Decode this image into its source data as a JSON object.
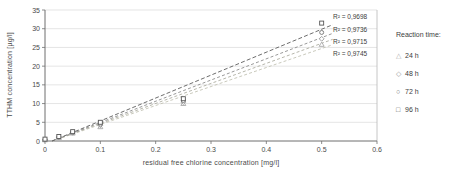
{
  "chart_data": {
    "type": "scatter",
    "title": "",
    "xlabel": "residual free chlorine concentration [mg/l]",
    "ylabel": "TTHM concentration [µg/l]",
    "xlim": [
      0,
      0.6
    ],
    "ylim": [
      0,
      35
    ],
    "x_ticks": [
      0,
      0.1,
      0.2,
      0.3,
      0.4,
      0.5,
      0.6
    ],
    "y_ticks": [
      0,
      5,
      10,
      15,
      20,
      25,
      30,
      35
    ],
    "grid": "horizontal",
    "legend_position": "right",
    "legend_title": "Reaction time:",
    "x": [
      0,
      0.025,
      0.05,
      0.1,
      0.25,
      0.5
    ],
    "series": [
      {
        "label": "24 h",
        "glyph": "△",
        "marker": "triangle",
        "color": "#a8a8a8",
        "line_color": "#c3c3b4",
        "r2": "R² = 0,9745",
        "values": [
          0.3,
          0.9,
          2.1,
          3.8,
          10.0,
          25.8
        ]
      },
      {
        "label": "48 h",
        "glyph": "◇",
        "marker": "diamond",
        "color": "#999999",
        "line_color": "#aeaea2",
        "r2": "R² = 0,9715",
        "values": [
          0.3,
          1.0,
          2.2,
          4.2,
          10.4,
          27.3
        ]
      },
      {
        "label": "72 h",
        "glyph": "○",
        "marker": "circle",
        "color": "#747474",
        "line_color": "#8d8d8d",
        "r2": "R² = 0,9736",
        "values": [
          0.4,
          1.1,
          2.3,
          4.5,
          10.8,
          29.0
        ]
      },
      {
        "label": "96 h",
        "glyph": "□",
        "marker": "square",
        "color": "#565656",
        "line_color": "#5c5c5c",
        "r2": "R² = 0,9698",
        "values": [
          0.5,
          1.2,
          2.5,
          5.0,
          11.3,
          31.5
        ]
      }
    ],
    "trend_x_end": 0.52,
    "colors": {
      "background": "#ffffff",
      "axis": "#6e6e6e",
      "plot_border": "#b8b8b8",
      "grid": "#d9d9d9",
      "text": "#4a4a4a"
    }
  }
}
